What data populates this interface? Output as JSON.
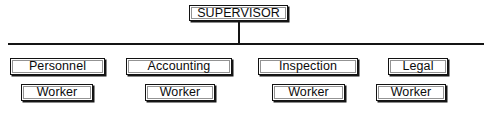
{
  "chart": {
    "type": "organizational-chart",
    "root": {
      "label": "SUPERVISOR",
      "x": 189,
      "y": 5,
      "width": 99,
      "height": 16
    },
    "connectors": {
      "stem": {
        "x": 238,
        "y": 21,
        "width": 2,
        "height": 24
      },
      "bus": {
        "x": 8,
        "y": 43,
        "width": 476,
        "height": 2
      }
    },
    "departments": [
      {
        "label": "Personnel",
        "x": 10,
        "y": 58,
        "width": 95,
        "height": 17,
        "worker": {
          "label": "Worker",
          "x": 21,
          "y": 84,
          "width": 72,
          "height": 17
        }
      },
      {
        "label": "Accounting",
        "x": 126,
        "y": 58,
        "width": 106,
        "height": 17,
        "worker": {
          "label": "Worker",
          "x": 145,
          "y": 84,
          "width": 70,
          "height": 17
        }
      },
      {
        "label": "Inspection",
        "x": 258,
        "y": 58,
        "width": 100,
        "height": 17,
        "worker": {
          "label": "Worker",
          "x": 272,
          "y": 84,
          "width": 73,
          "height": 17
        }
      },
      {
        "label": "Legal",
        "x": 388,
        "y": 58,
        "width": 60,
        "height": 17,
        "worker": {
          "label": "Worker",
          "x": 376,
          "y": 84,
          "width": 70,
          "height": 17
        }
      }
    ],
    "colors": {
      "background": "#ffffff",
      "ink": "#121212",
      "shadow": "#161616"
    }
  }
}
